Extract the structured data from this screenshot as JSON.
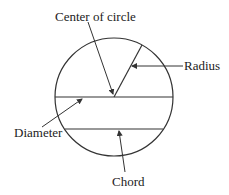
{
  "diagram": {
    "labels": {
      "center": "Center of circle",
      "radius": "Radius",
      "diameter": "Diameter",
      "chord": "Chord"
    },
    "colors": {
      "stroke": "#333333",
      "text": "#222222",
      "background": "#ffffff"
    }
  }
}
